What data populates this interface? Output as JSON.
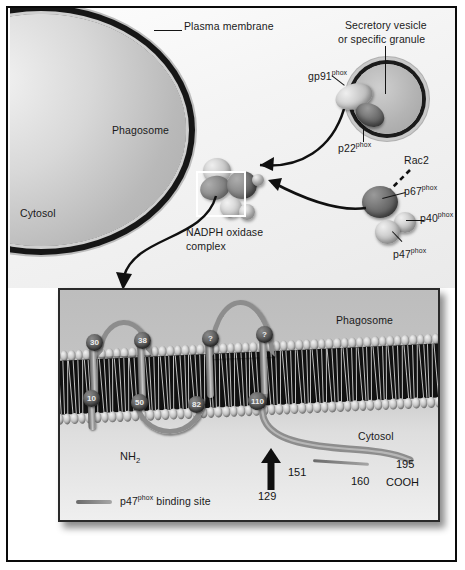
{
  "figure": {
    "top_panel": {
      "labels": {
        "plasma_membrane": "Plasma membrane",
        "phagosome": "Phagosome",
        "cytosol": "Cytosol",
        "secretory_vesicle_line1": "Secretory vesicle",
        "secretory_vesicle_line2": "or specific granule",
        "nadph_line1": "NADPH oxidase",
        "nadph_line2": "complex"
      },
      "proteins": [
        {
          "name": "gp91",
          "superscript": "phox"
        },
        {
          "name": "p22",
          "superscript": "phox"
        },
        {
          "name": "Rac2",
          "superscript": ""
        },
        {
          "name": "p67",
          "superscript": "phox"
        },
        {
          "name": "p40",
          "superscript": "phox"
        },
        {
          "name": "p47",
          "superscript": "phox"
        }
      ]
    },
    "bottom_panel": {
      "labels": {
        "phagosome": "Phagosome",
        "cytosol": "Cytosol",
        "n_terminus": "NH",
        "n_terminus_sub": "2",
        "c_terminus": "COOH"
      },
      "residues_top": [
        "30",
        "38",
        "?",
        "?"
      ],
      "residues_bottom": [
        "10",
        "50",
        "82",
        "110"
      ],
      "annotations": [
        {
          "value": "129",
          "type": "arrow-marker"
        },
        {
          "value": "151",
          "type": "binding-start"
        },
        {
          "value": "160",
          "type": "binding-end"
        },
        {
          "value": "195",
          "type": "c-terminal-residue"
        }
      ],
      "legend": {
        "label_prefix": "p47",
        "label_superscript": "phox",
        "label_suffix": " binding site"
      }
    },
    "colors": {
      "frame": "#0a0a0a",
      "membrane_dark": "#161616",
      "protein_dark": "#5c5c5c",
      "protein_light": "#cbcbcb",
      "panel_bg": "#c4c4c4"
    }
  }
}
